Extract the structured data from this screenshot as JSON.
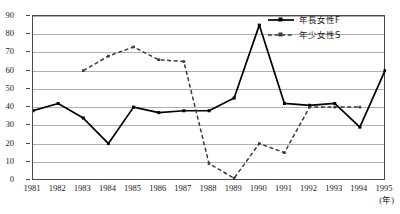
{
  "top_remnant_text": "",
  "chart_data": {
    "type": "line",
    "title": "",
    "xlabel": "(年)",
    "ylabel": "",
    "x": [
      1981,
      1982,
      1983,
      1984,
      1985,
      1986,
      1987,
      1988,
      1989,
      1990,
      1991,
      1992,
      1993,
      1994,
      1995
    ],
    "xtick_labels": [
      "1981",
      "1982",
      "1983",
      "1984",
      "1985",
      "1986",
      "1987",
      "1988",
      "1989",
      "1990",
      "1991",
      "1992",
      "1993",
      "1994",
      "1995"
    ],
    "ytick_labels": [
      "0",
      "10",
      "20",
      "30",
      "40",
      "50",
      "60",
      "70",
      "80",
      "90"
    ],
    "yticks": [
      0,
      10,
      20,
      30,
      40,
      50,
      60,
      70,
      80,
      90
    ],
    "ylim": [
      0,
      90
    ],
    "xlim": [
      1981,
      1995
    ],
    "grid": "horizontal",
    "legend_position": "upper-right",
    "series": [
      {
        "name": "年長女性F",
        "style": "solid",
        "marker": "square",
        "color": "#000000",
        "x": [
          1981,
          1982,
          1983,
          1984,
          1985,
          1986,
          1987,
          1988,
          1989,
          1990,
          1991,
          1992,
          1993,
          1994,
          1995
        ],
        "values": [
          38,
          42,
          34,
          20,
          40,
          37,
          38,
          38,
          45,
          85,
          42,
          41,
          42,
          29,
          60
        ]
      },
      {
        "name": "年少女性S",
        "style": "dashed",
        "marker": "square",
        "color": "#3a3a3a",
        "x": [
          1983,
          1984,
          1985,
          1986,
          1987,
          1988,
          1989,
          1990,
          1991,
          1992,
          1993,
          1994
        ],
        "values": [
          60,
          68,
          73,
          66,
          65,
          9,
          1,
          20,
          15,
          40,
          40,
          40
        ]
      }
    ]
  },
  "legend": {
    "entries": [
      {
        "label": "年長女性F"
      },
      {
        "label": "年少女性S"
      }
    ]
  },
  "axis_unit": {
    "x": "(年)"
  }
}
